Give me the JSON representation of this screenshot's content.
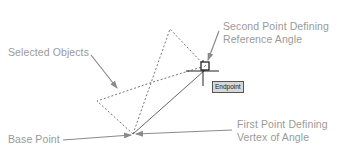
{
  "labels": {
    "selected_objects": "Selected Objects",
    "second_point_line1": "Second Point Defining",
    "second_point_line2": "Reference Angle",
    "base_point": "Base Point",
    "first_point_line1": "First Point Defining",
    "first_point_line2": "Vertex of Angle"
  },
  "tooltip": {
    "osnap_label": "Endpoint"
  },
  "colors": {
    "label_text": "#9a9a9a",
    "leader_arrow": "#8a8a8a",
    "dashed_objects": "#666666",
    "reference_line": "#555555",
    "crosshair": "#222222",
    "tooltip_bg": "#d8d8d8"
  },
  "icons": {
    "endpoint_marker": "square-snap-marker-icon",
    "cursor": "crosshair-cursor-icon"
  }
}
